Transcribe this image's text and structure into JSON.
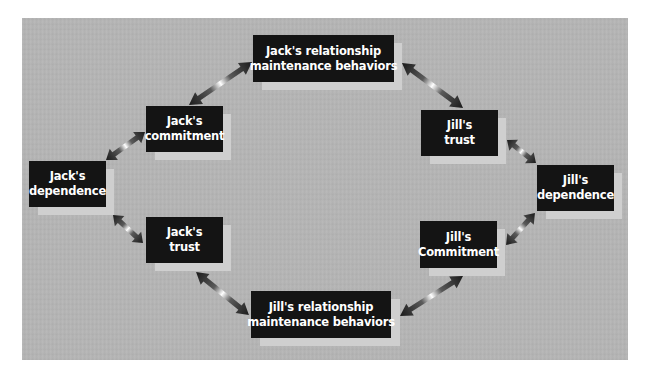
{
  "diagram": {
    "title": "",
    "nodes": [
      {
        "id": "jack-rmb",
        "line1": "Jack's relationship",
        "line2": "maintenance behaviors"
      },
      {
        "id": "jack-commitment",
        "line1": "Jack's",
        "line2": "commitment"
      },
      {
        "id": "jack-dependence",
        "line1": "Jack's",
        "line2": "dependence"
      },
      {
        "id": "jack-trust",
        "line1": "Jack's",
        "line2": "trust"
      },
      {
        "id": "jill-rmb",
        "line1": "Jill's relationship",
        "line2": "maintenance behaviors"
      },
      {
        "id": "jill-commitment",
        "line1": "Jill's",
        "line2": "Commitment"
      },
      {
        "id": "jill-dependence",
        "line1": "Jill's",
        "line2": "dependence"
      },
      {
        "id": "jill-trust",
        "line1": "Jill's",
        "line2": "trust"
      }
    ],
    "edges": [
      {
        "from": "jack-rmb",
        "to": "jack-commitment",
        "type": "bidirectional"
      },
      {
        "from": "jack-commitment",
        "to": "jack-dependence",
        "type": "bidirectional"
      },
      {
        "from": "jack-dependence",
        "to": "jack-trust",
        "type": "bidirectional"
      },
      {
        "from": "jack-trust",
        "to": "jill-rmb",
        "type": "bidirectional"
      },
      {
        "from": "jill-rmb",
        "to": "jill-commitment",
        "type": "bidirectional"
      },
      {
        "from": "jill-commitment",
        "to": "jill-dependence",
        "type": "bidirectional"
      },
      {
        "from": "jill-dependence",
        "to": "jill-trust",
        "type": "bidirectional"
      },
      {
        "from": "jill-trust",
        "to": "jack-rmb",
        "type": "bidirectional"
      }
    ],
    "colors": {
      "panel_background": "#b4b4b4",
      "node_fill": "#141414",
      "node_text": "#ffffff",
      "node_shadow": "#cfcfcf",
      "arrow_dark": "#1a1a1a",
      "arrow_glow": "#ffffff"
    }
  }
}
